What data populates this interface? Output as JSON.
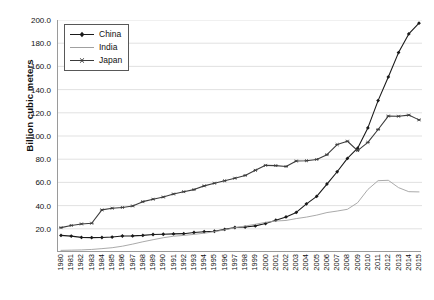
{
  "chart_data": {
    "type": "line",
    "title": "",
    "xlabel": "",
    "ylabel": "Billion cubic meters",
    "ylim": [
      0,
      200
    ],
    "ytick_step": 20,
    "yticks": [
      "200.0",
      "180.0",
      "160.0",
      "140.0",
      "120.0",
      "100.0",
      "80.0",
      "60.0",
      "40.0",
      "20.0"
    ],
    "grid": true,
    "grid_axis": "y",
    "legend_position": "top-left",
    "x": [
      "1980",
      "1981",
      "1982",
      "1983",
      "1984",
      "1985",
      "1986",
      "1987",
      "1988",
      "1989",
      "1990",
      "1991",
      "1992",
      "1993",
      "1994",
      "1995",
      "1996",
      "1997",
      "1998",
      "1999",
      "2000",
      "2001",
      "2002",
      "2003",
      "2004",
      "2005",
      "2006",
      "2007",
      "2008",
      "2009",
      "2010",
      "2011",
      "2012",
      "2013",
      "2014",
      "2015"
    ],
    "categories": [
      "1980",
      "1981",
      "1982",
      "1983",
      "1984",
      "1985",
      "1986",
      "1987",
      "1988",
      "1989",
      "1990",
      "1991",
      "1992",
      "1993",
      "1994",
      "1995",
      "1996",
      "1997",
      "1998",
      "1999",
      "2000",
      "2001",
      "2002",
      "2003",
      "2004",
      "2005",
      "2006",
      "2007",
      "2008",
      "2009",
      "2010",
      "2011",
      "2012",
      "2013",
      "2014",
      "2015"
    ],
    "series": [
      {
        "name": "China",
        "color": "#1a1a1a",
        "marker": "diamond",
        "values": [
          14.3,
          13.7,
          12.6,
          12.4,
          12.5,
          12.9,
          13.8,
          13.9,
          14.3,
          15.1,
          15.3,
          15.6,
          15.8,
          16.8,
          17.5,
          17.9,
          19.5,
          21.1,
          21.5,
          22.5,
          24.5,
          27.4,
          30.2,
          34.1,
          41.5,
          48.0,
          58.6,
          69.2,
          80.7,
          89.5,
          107.0,
          130.5,
          150.9,
          171.9,
          188.0,
          197.3
        ]
      },
      {
        "name": "India",
        "color": "#a0a0a0",
        "marker": "none",
        "values": [
          1.4,
          1.6,
          1.8,
          2.2,
          2.9,
          3.7,
          5.0,
          6.8,
          8.8,
          10.6,
          12.3,
          13.6,
          14.3,
          15.2,
          16.2,
          17.5,
          19.1,
          20.9,
          22.4,
          23.9,
          25.6,
          26.7,
          27.2,
          28.8,
          30.1,
          31.8,
          34.0,
          35.3,
          36.8,
          42.5,
          53.9,
          61.5,
          61.8,
          55.5,
          52.0,
          51.8
        ]
      },
      {
        "name": "Japan",
        "color": "#3b3b3b",
        "marker": "asterisk",
        "values": [
          21.0,
          22.9,
          24.2,
          24.8,
          36.3,
          37.7,
          38.4,
          39.7,
          43.4,
          45.5,
          47.4,
          50.0,
          52.0,
          53.8,
          57.0,
          59.3,
          61.4,
          63.6,
          66.0,
          70.4,
          74.7,
          74.5,
          73.7,
          78.4,
          78.7,
          79.8,
          83.9,
          92.6,
          95.5,
          87.4,
          94.5,
          105.6,
          117.2,
          117.0,
          118.0,
          113.9
        ]
      }
    ],
    "legend": [
      {
        "name": "China",
        "color": "#1a1a1a",
        "marker": "diamond"
      },
      {
        "name": "India",
        "color": "#a0a0a0",
        "marker": "none"
      },
      {
        "name": "Japan",
        "color": "#3b3b3b",
        "marker": "asterisk"
      }
    ]
  }
}
